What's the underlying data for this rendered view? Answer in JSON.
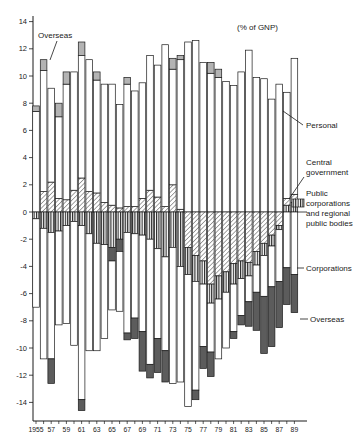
{
  "colors": {
    "background": "#ffffff",
    "bar_border": "#1a1a1a",
    "personal_fill": "#ffffff",
    "corporations_fill": "#ffffff",
    "overseas_surplus_fill": "#b3b3b3",
    "overseas_deficit_fill": "#5c5c5c",
    "hatch_line": "#333333",
    "stripe_line": "#222222",
    "axis": "#1a1a1a",
    "text": "#1a1a1a"
  },
  "chart_data": {
    "type": "bar",
    "stacked": true,
    "unit_label": "(% of GNP)",
    "ylabel": "",
    "xlabel": "",
    "ylim": [
      -15.4,
      14.8
    ],
    "yticks": [
      14,
      12,
      10,
      8,
      6,
      4,
      2,
      0,
      -2,
      -4,
      -6,
      -8,
      -10,
      -12,
      -14
    ],
    "xtick_labels": [
      "1955",
      "57",
      "59",
      "61",
      "63",
      "65",
      "67",
      "69",
      "71",
      "73",
      "75",
      "77",
      "79",
      "81",
      "83",
      "85",
      "87",
      "89"
    ],
    "grid": false,
    "legend_position": "right-annotations",
    "annotations": {
      "overseas_top": "Overseas",
      "unit": "(% of GNP)",
      "personal": "Personal",
      "central_government": [
        "Central",
        "government"
      ],
      "public_corporations": [
        "Public",
        "corporations",
        "and regional",
        "public bodies"
      ],
      "corporations": "Corporations",
      "overseas_right": "Overseas"
    },
    "series": [
      {
        "key": "personal",
        "label": "Personal",
        "pattern": "white"
      },
      {
        "key": "central_government",
        "label": "Central government",
        "pattern": "diagonal-hatch"
      },
      {
        "key": "public_corporations",
        "label": "Public corporations and regional public bodies",
        "pattern": "vertical-stripes"
      },
      {
        "key": "corporations",
        "label": "Corporations",
        "pattern": "white"
      },
      {
        "key": "overseas",
        "label": "Overseas",
        "pattern": "gray-when-surplus-dark-when-deficit"
      }
    ],
    "bars": [
      {
        "year": 1955,
        "pos": [
          [
            "personal",
            7.4
          ],
          [
            "overseas",
            0.4
          ]
        ],
        "neg": [
          [
            "public_corporations",
            0.5
          ],
          [
            "corporations",
            6.5
          ]
        ]
      },
      {
        "year": 1956,
        "pos": [
          [
            "central_government",
            1.5
          ],
          [
            "personal",
            8.9
          ],
          [
            "overseas",
            0.8
          ]
        ],
        "neg": [
          [
            "public_corporations",
            1.2
          ],
          [
            "corporations",
            9.6
          ]
        ]
      },
      {
        "year": 1957,
        "pos": [
          [
            "central_government",
            2.2
          ],
          [
            "personal",
            6.9
          ]
        ],
        "neg": [
          [
            "public_corporations",
            1.5
          ],
          [
            "corporations",
            9.3
          ],
          [
            "overseas",
            1.8
          ]
        ]
      },
      {
        "year": 1958,
        "pos": [
          [
            "central_government",
            1.0
          ],
          [
            "personal",
            6.0
          ],
          [
            "overseas",
            1.0
          ]
        ],
        "neg": [
          [
            "public_corporations",
            1.4
          ],
          [
            "corporations",
            6.9
          ]
        ]
      },
      {
        "year": 1959,
        "pos": [
          [
            "central_government",
            0.9
          ],
          [
            "personal",
            8.5
          ],
          [
            "overseas",
            0.9
          ]
        ],
        "neg": [
          [
            "public_corporations",
            1.0
          ],
          [
            "corporations",
            7.2
          ]
        ]
      },
      {
        "year": 1960,
        "pos": [
          [
            "central_government",
            1.6
          ],
          [
            "personal",
            8.7
          ]
        ],
        "neg": [
          [
            "public_corporations",
            0.7
          ],
          [
            "corporations",
            9.1
          ]
        ]
      },
      {
        "year": 1961,
        "pos": [
          [
            "central_government",
            2.5
          ],
          [
            "personal",
            9.0
          ],
          [
            "overseas",
            1.0
          ]
        ],
        "neg": [
          [
            "public_corporations",
            1.0
          ],
          [
            "corporations",
            12.8
          ],
          [
            "overseas",
            0.8
          ]
        ]
      },
      {
        "year": 1962,
        "pos": [
          [
            "central_government",
            1.5
          ],
          [
            "personal",
            9.7
          ]
        ],
        "neg": [
          [
            "public_corporations",
            1.6
          ],
          [
            "corporations",
            8.6
          ]
        ]
      },
      {
        "year": 1963,
        "pos": [
          [
            "central_government",
            1.4
          ],
          [
            "personal",
            8.3
          ],
          [
            "overseas",
            0.6
          ]
        ],
        "neg": [
          [
            "public_corporations",
            2.3
          ],
          [
            "corporations",
            7.9
          ]
        ]
      },
      {
        "year": 1964,
        "pos": [
          [
            "central_government",
            0.7
          ],
          [
            "personal",
            8.7
          ]
        ],
        "neg": [
          [
            "public_corporations",
            2.4
          ],
          [
            "corporations",
            6.9
          ]
        ]
      },
      {
        "year": 1965,
        "pos": [
          [
            "central_government",
            0.5
          ],
          [
            "personal",
            8.9
          ]
        ],
        "neg": [
          [
            "public_corporations",
            2.6
          ],
          [
            "overseas",
            1.0
          ],
          [
            "corporations",
            3.6
          ]
        ]
      },
      {
        "year": 1966,
        "pos": [
          [
            "central_government",
            0.3
          ],
          [
            "personal",
            7.6
          ]
        ],
        "neg": [
          [
            "public_corporations",
            2.0
          ],
          [
            "overseas",
            0.9
          ],
          [
            "corporations",
            4.4
          ]
        ]
      },
      {
        "year": 1967,
        "pos": [
          [
            "central_government",
            0.4
          ],
          [
            "personal",
            9.0
          ],
          [
            "overseas",
            0.5
          ]
        ],
        "neg": [
          [
            "public_corporations",
            1.5
          ],
          [
            "corporations",
            7.4
          ],
          [
            "overseas",
            0.5
          ]
        ]
      },
      {
        "year": 1968,
        "pos": [
          [
            "central_government",
            0.4
          ],
          [
            "personal",
            8.5
          ]
        ],
        "neg": [
          [
            "public_corporations",
            1.6
          ],
          [
            "corporations",
            6.2
          ],
          [
            "overseas",
            1.5
          ]
        ]
      },
      {
        "year": 1969,
        "pos": [
          [
            "central_government",
            1.0
          ],
          [
            "personal",
            8.5
          ]
        ],
        "neg": [
          [
            "public_corporations",
            1.7
          ],
          [
            "corporations",
            7.1
          ],
          [
            "overseas",
            2.9
          ]
        ]
      },
      {
        "year": 1970,
        "pos": [
          [
            "central_government",
            1.6
          ],
          [
            "personal",
            9.9
          ]
        ],
        "neg": [
          [
            "public_corporations",
            2.0
          ],
          [
            "corporations",
            9.2
          ],
          [
            "overseas",
            1.0
          ]
        ]
      },
      {
        "year": 1971,
        "pos": [
          [
            "central_government",
            1.1
          ],
          [
            "personal",
            9.7
          ]
        ],
        "neg": [
          [
            "public_corporations",
            2.7
          ],
          [
            "corporations",
            6.6
          ],
          [
            "overseas",
            2.5
          ]
        ]
      },
      {
        "year": 1972,
        "pos": [
          [
            "central_government",
            0.4
          ],
          [
            "personal",
            11.9
          ]
        ],
        "neg": [
          [
            "public_corporations",
            3.3
          ],
          [
            "corporations",
            6.9
          ],
          [
            "overseas",
            2.3
          ]
        ]
      },
      {
        "year": 1973,
        "pos": [
          [
            "central_government",
            2.0
          ],
          [
            "personal",
            8.5
          ],
          [
            "overseas",
            0.8
          ]
        ],
        "neg": [
          [
            "public_corporations",
            2.6
          ],
          [
            "corporations",
            10.0
          ]
        ]
      },
      {
        "year": 1974,
        "pos": [
          [
            "central_government",
            0.2
          ],
          [
            "personal",
            11.0
          ],
          [
            "overseas",
            0.3
          ]
        ],
        "neg": [
          [
            "public_corporations",
            4.0
          ],
          [
            "corporations",
            8.5
          ]
        ]
      },
      {
        "year": 1975,
        "pos": [
          [
            "personal",
            12.5
          ]
        ],
        "neg": [
          [
            "central_government",
            2.6
          ],
          [
            "public_corporations",
            2.0
          ],
          [
            "corporations",
            9.7
          ]
        ]
      },
      {
        "year": 1976,
        "pos": [
          [
            "personal",
            12.6
          ]
        ],
        "neg": [
          [
            "central_government",
            3.2
          ],
          [
            "public_corporations",
            1.9
          ],
          [
            "corporations",
            8.0
          ],
          [
            "overseas",
            0.7
          ]
        ]
      },
      {
        "year": 1977,
        "pos": [
          [
            "personal",
            11.0
          ]
        ],
        "neg": [
          [
            "central_government",
            3.6
          ],
          [
            "public_corporations",
            1.7
          ],
          [
            "corporations",
            4.6
          ],
          [
            "overseas",
            1.6
          ]
        ]
      },
      {
        "year": 1978,
        "pos": [
          [
            "personal",
            10.2
          ],
          [
            "overseas",
            0.8
          ]
        ],
        "neg": [
          [
            "central_government",
            5.3
          ],
          [
            "public_corporations",
            1.4
          ],
          [
            "corporations",
            3.6
          ],
          [
            "overseas",
            1.8
          ]
        ]
      },
      {
        "year": 1979,
        "pos": [
          [
            "personal",
            9.9
          ],
          [
            "overseas",
            0.6
          ]
        ],
        "neg": [
          [
            "central_government",
            4.7
          ],
          [
            "public_corporations",
            1.7
          ],
          [
            "corporations",
            4.4
          ]
        ]
      },
      {
        "year": 1980,
        "pos": [
          [
            "personal",
            9.6
          ]
        ],
        "neg": [
          [
            "central_government",
            4.4
          ],
          [
            "public_corporations",
            1.5
          ],
          [
            "corporations",
            4.1
          ]
        ]
      },
      {
        "year": 1981,
        "pos": [
          [
            "personal",
            9.3
          ]
        ],
        "neg": [
          [
            "central_government",
            3.8
          ],
          [
            "public_corporations",
            1.5
          ],
          [
            "corporations",
            3.5
          ],
          [
            "overseas",
            0.5
          ]
        ]
      },
      {
        "year": 1982,
        "pos": [
          [
            "personal",
            10.3
          ]
        ],
        "neg": [
          [
            "central_government",
            3.6
          ],
          [
            "public_corporations",
            1.3
          ],
          [
            "corporations",
            2.7
          ],
          [
            "overseas",
            0.7
          ]
        ]
      },
      {
        "year": 1983,
        "pos": [
          [
            "personal",
            11.9
          ]
        ],
        "neg": [
          [
            "central_government",
            3.7
          ],
          [
            "public_corporations",
            1.0
          ],
          [
            "corporations",
            1.9
          ],
          [
            "overseas",
            1.8
          ]
        ]
      },
      {
        "year": 1984,
        "pos": [
          [
            "personal",
            9.9
          ]
        ],
        "neg": [
          [
            "central_government",
            2.9
          ],
          [
            "public_corporations",
            1.0
          ],
          [
            "corporations",
            2.0
          ],
          [
            "overseas",
            2.8
          ]
        ]
      },
      {
        "year": 1985,
        "pos": [
          [
            "personal",
            9.8
          ]
        ],
        "neg": [
          [
            "central_government",
            2.3
          ],
          [
            "public_corporations",
            0.9
          ],
          [
            "corporations",
            3.0
          ],
          [
            "overseas",
            4.2
          ]
        ]
      },
      {
        "year": 1986,
        "pos": [
          [
            "personal",
            8.3
          ]
        ],
        "neg": [
          [
            "central_government",
            1.7
          ],
          [
            "public_corporations",
            0.8
          ],
          [
            "corporations",
            3.0
          ],
          [
            "overseas",
            4.4
          ]
        ]
      },
      {
        "year": 1987,
        "pos": [
          [
            "personal",
            9.4
          ]
        ],
        "neg": [
          [
            "central_government",
            1.0
          ],
          [
            "public_corporations",
            0.3
          ],
          [
            "corporations",
            3.8
          ],
          [
            "overseas",
            3.4
          ]
        ]
      },
      {
        "year": 1988,
        "pos": [
          [
            "public_corporations",
            0.5
          ],
          [
            "central_government",
            0.5
          ],
          [
            "personal",
            7.8
          ]
        ],
        "neg": [
          [
            "corporations",
            4.1
          ],
          [
            "overseas",
            2.7
          ]
        ]
      },
      {
        "year": 1989,
        "pos": [
          [
            "public_corporations",
            0.7
          ],
          [
            "central_government",
            0.6
          ],
          [
            "personal",
            10.0
          ]
        ],
        "neg": [
          [
            "corporations",
            4.6
          ],
          [
            "overseas",
            2.8
          ]
        ]
      }
    ]
  }
}
